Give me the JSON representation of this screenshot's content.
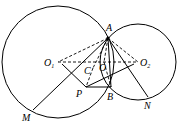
{
  "diagram": {
    "type": "geometry",
    "circles": [
      {
        "name": "O1",
        "cx": 58,
        "cy": 62,
        "r": 56
      },
      {
        "name": "O2",
        "cx": 138,
        "cy": 62,
        "r": 38
      }
    ],
    "points": {
      "A": {
        "x": 108,
        "y": 38,
        "label": "A"
      },
      "B": {
        "x": 111,
        "y": 87,
        "label": "B"
      },
      "O1": {
        "x": 58,
        "y": 62,
        "label": "O",
        "sub": "1"
      },
      "O2": {
        "x": 138,
        "y": 62,
        "label": "O",
        "sub": "2"
      },
      "O": {
        "x": 104,
        "y": 62,
        "label": "O"
      },
      "C": {
        "x": 93,
        "y": 68,
        "label": "C"
      },
      "P": {
        "x": 86,
        "y": 87,
        "label": "P"
      },
      "M": {
        "x": 33,
        "y": 110,
        "label": "M"
      },
      "N": {
        "x": 148,
        "y": 97,
        "label": "N"
      }
    }
  }
}
